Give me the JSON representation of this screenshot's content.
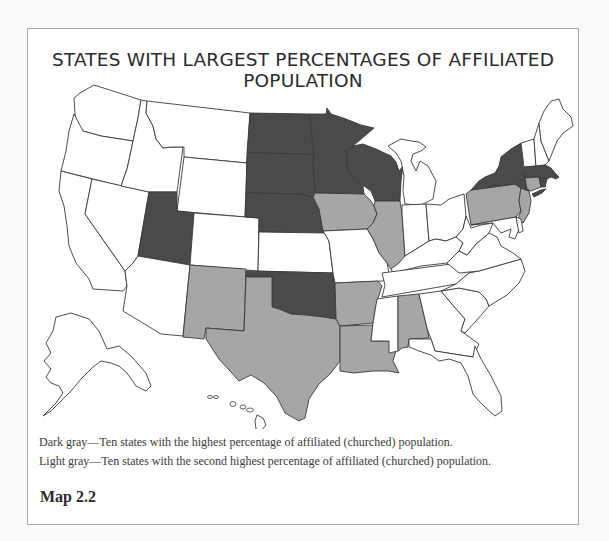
{
  "figure": {
    "title": "STATES WITH LARGEST PERCENTAGES OF AFFILIATED POPULATION",
    "caption": "Map 2.2"
  },
  "legend": {
    "dark": "Dark gray—Ten states with the highest percentage of affiliated (churched) population.",
    "light": "Light gray—Ten states with the second highest percentage of affiliated (churched) population."
  },
  "colors": {
    "dark": "#4a4a4a",
    "light": "#a6a6a6",
    "none": "#ffffff",
    "stroke": "#3a3a3a"
  },
  "map": {
    "dark_states": [
      "North Dakota",
      "South Dakota",
      "Nebraska",
      "Minnesota",
      "Wisconsin",
      "Utah",
      "Oklahoma",
      "New York",
      "Massachusetts",
      "Rhode Island"
    ],
    "light_states": [
      "Iowa",
      "Illinois",
      "New Mexico",
      "Texas",
      "Arkansas",
      "Louisiana",
      "Alabama",
      "Pennsylvania",
      "New Jersey",
      "Connecticut"
    ]
  }
}
